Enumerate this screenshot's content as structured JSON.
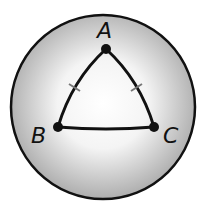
{
  "diagram": {
    "type": "spherical-triangle",
    "sphere": {
      "fill_center": "#ffffff",
      "fill_edge": "#a8a8a8",
      "stroke": "#111111"
    },
    "vertices": [
      {
        "label": "A",
        "x": 106,
        "y": 49
      },
      {
        "label": "B",
        "x": 58,
        "y": 127
      },
      {
        "label": "C",
        "x": 154,
        "y": 127
      }
    ],
    "congruence_marks": [
      "AB",
      "AC"
    ]
  }
}
